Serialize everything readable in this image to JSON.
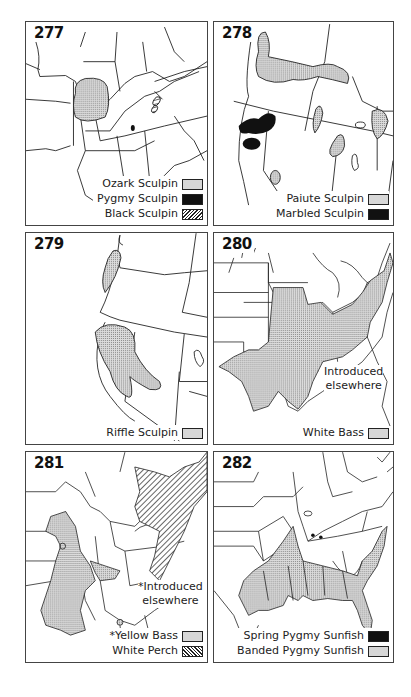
{
  "panels": [
    {
      "number": "277",
      "legend": [
        {
          "label": "Ozark Sculpin",
          "pattern": "stipple"
        },
        {
          "label": "Pygmy Sculpin",
          "pattern": "solid"
        },
        {
          "label": "Black Sculpin",
          "pattern": "hatch"
        }
      ]
    },
    {
      "number": "278",
      "legend": [
        {
          "label": "Paiute Sculpin",
          "pattern": "stipple"
        },
        {
          "label": "Marbled Sculpin",
          "pattern": "solid"
        }
      ]
    },
    {
      "number": "279",
      "legend": [
        {
          "label": "Riffle Sculpin",
          "pattern": "stipple"
        }
      ]
    },
    {
      "number": "280",
      "note": [
        "Introduced",
        "elsewhere"
      ],
      "legend": [
        {
          "label": "White Bass",
          "pattern": "stipple"
        }
      ]
    },
    {
      "number": "281",
      "note": [
        "*Introduced",
        "elsewhere"
      ],
      "legend": [
        {
          "label": "*Yellow Bass",
          "pattern": "stipple"
        },
        {
          "label": "White Perch",
          "pattern": "hatch"
        }
      ]
    },
    {
      "number": "282",
      "legend": [
        {
          "label": "Spring Pygmy Sunfish",
          "pattern": "solid"
        },
        {
          "label": "Banded Pygmy Sunfish",
          "pattern": "stipple"
        }
      ]
    }
  ],
  "colors": {
    "line": "#222222",
    "stipple": "#d7d7d7",
    "solid": "#111111",
    "background": "#ffffff"
  }
}
